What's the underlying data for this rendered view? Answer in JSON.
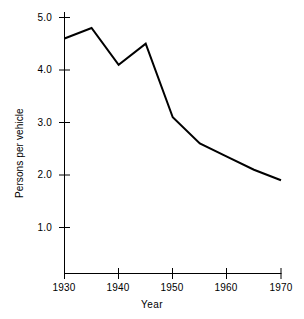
{
  "chart_data": {
    "type": "line",
    "title": "",
    "xlabel": "Year",
    "ylabel": "Persons per vehicle",
    "x": [
      1930,
      1935,
      1940,
      1945,
      1950,
      1955,
      1960,
      1965,
      1970
    ],
    "values": [
      4.6,
      4.8,
      4.1,
      4.5,
      3.1,
      2.6,
      2.35,
      2.1,
      1.9
    ],
    "series": [
      {
        "name": "Persons per vehicle",
        "values": [
          4.6,
          4.8,
          4.1,
          4.5,
          3.1,
          2.6,
          2.35,
          2.1,
          1.9
        ]
      }
    ],
    "xlim": [
      1930,
      1970
    ],
    "ylim": [
      0,
      5.2
    ],
    "xticks": [
      1930,
      1940,
      1950,
      1960,
      1970
    ],
    "xtick_labels": [
      "1930",
      "1940",
      "1950",
      "1960",
      "1970"
    ],
    "yticks": [
      1.0,
      2.0,
      3.0,
      4.0,
      5.0
    ],
    "ytick_labels": [
      "1.0",
      "2.0",
      "3.0",
      "4.0",
      "5.0"
    ],
    "grid": false,
    "legend": false,
    "legend_position": "none",
    "line_color": "#000000",
    "axis_color": "#000000",
    "background_color": "#ffffff"
  }
}
